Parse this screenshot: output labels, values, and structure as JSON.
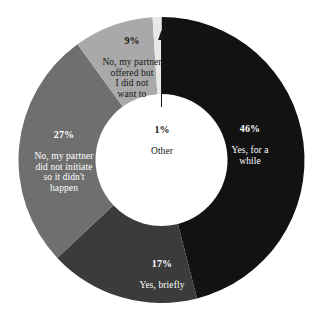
{
  "chart_data": {
    "type": "pie",
    "variant": "donut",
    "title": "",
    "subtitle": "",
    "xlabel": "",
    "ylabel": "",
    "legend": "none",
    "grid": false,
    "value_unit": "percent",
    "total": 100,
    "categories": [
      "Yes, for a while",
      "Yes, briefly",
      "No, my partner did not initiate so it didn't happen",
      "No, my partner offered but I did not want to",
      "Other"
    ],
    "values": [
      46,
      17,
      27,
      9,
      1
    ],
    "slices": [
      {
        "id": "yes-while",
        "label": "Yes, for a while",
        "label_lines": "Yes, for a\nwhile",
        "percent_text": "46%",
        "value": 46,
        "color": "#121212",
        "text_color": "#ffffff",
        "start_angle": 0,
        "end_angle": 165.6
      },
      {
        "id": "yes-briefly",
        "label": "Yes, briefly",
        "label_lines": "Yes, briefly",
        "percent_text": "17%",
        "value": 17,
        "color": "#3b3b3b",
        "text_color": "#ffffff",
        "start_angle": 165.6,
        "end_angle": 226.8
      },
      {
        "id": "no-not-initiate",
        "label": "No, my partner did not initiate so it didn't happen",
        "label_lines": "No, my partner\ndid not initiate\nso it didn't\nhappen",
        "percent_text": "27%",
        "value": 27,
        "color": "#6f6f6f",
        "text_color": "#ffffff",
        "start_angle": 226.8,
        "end_angle": 324.0
      },
      {
        "id": "no-offered",
        "label": "No, my partner offered but I did not want to",
        "label_lines": "No, my partner\noffered but\nI did not\nwant to",
        "percent_text": "9%",
        "value": 9,
        "color": "#a9a9a9",
        "text_color": "#ffffff",
        "start_angle": 324.0,
        "end_angle": 356.4
      },
      {
        "id": "other",
        "label": "Other",
        "label_lines": "Other",
        "percent_text": "1%",
        "value": 1,
        "color": "#e8e8e8",
        "text_color": "#161616",
        "start_angle": 356.4,
        "end_angle": 360.0
      }
    ],
    "annotations": [
      {
        "id": "other-leader",
        "type": "arrow",
        "points_to": "Other",
        "from_label": "1% Other",
        "direction": "up"
      }
    ],
    "geometry": {
      "center_x": 161.5,
      "center_y": 160,
      "outer_radius": 143,
      "inner_radius": 66,
      "background": "#ffffff"
    }
  },
  "labels": {
    "yes_while": {
      "percent": "46%",
      "name": "Yes, for a\nwhile"
    },
    "yes_briefly": {
      "percent": "17%",
      "name": "Yes, briefly"
    },
    "no_not_initiate": {
      "percent": "27%",
      "name": "No, my partner\ndid not initiate\nso it didn't\nhappen"
    },
    "no_offered": {
      "percent": "9%",
      "name": "No, my partner\noffered but\nI did not\nwant to"
    },
    "other": {
      "percent": "1%",
      "name": "Other"
    }
  }
}
